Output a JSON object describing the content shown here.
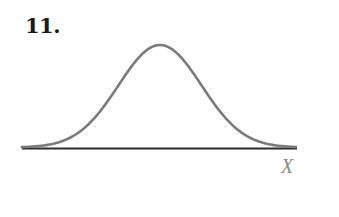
{
  "problem": {
    "number_label": "11."
  },
  "figure": {
    "axis_label": "X",
    "colors": {
      "curve": "#7a7a7a",
      "axis": "#2b2b2b",
      "axis_label": "#8a8a8a"
    }
  },
  "chart_data": {
    "type": "line",
    "title": "",
    "xlabel": "X",
    "ylabel": "",
    "x_ticks": [],
    "y_ticks": [],
    "grid": false,
    "legend": null,
    "series": [
      {
        "name": "density",
        "shape": "normal",
        "symmetric": true,
        "peak_position": "center",
        "x": [
          -3.0,
          -2.5,
          -2.0,
          -1.5,
          -1.0,
          -0.5,
          0.0,
          0.5,
          1.0,
          1.5,
          2.0,
          2.5,
          3.0
        ],
        "values": [
          0.004,
          0.018,
          0.054,
          0.13,
          0.242,
          0.352,
          0.399,
          0.352,
          0.242,
          0.13,
          0.054,
          0.018,
          0.004
        ]
      }
    ]
  }
}
